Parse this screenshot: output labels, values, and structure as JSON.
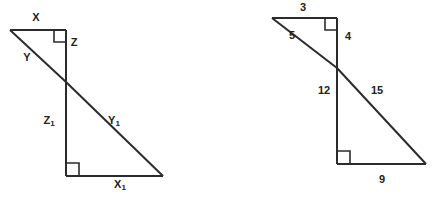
{
  "canvas": {
    "width": 433,
    "height": 197,
    "background": "#ffffff",
    "stroke_color": "#2b2b2b",
    "text_color": "#222222"
  },
  "figures": [
    {
      "id": "left-figure",
      "name": "similar-triangles-variables",
      "description": "Two similar right triangles sharing a vertex, labeled with variables",
      "small_triangle": {
        "name": "small-triangle-upper",
        "vertices": {
          "apex": [
            10,
            30
          ],
          "corner": [
            66,
            30
          ],
          "shared": [
            66,
            82
          ]
        },
        "labels": [
          {
            "key": "x",
            "text": "X",
            "sub": "",
            "x": 36,
            "y": 18
          },
          {
            "key": "y",
            "text": "Y",
            "sub": "",
            "x": 27,
            "y": 58
          },
          {
            "key": "z",
            "text": "Z",
            "sub": "",
            "x": 74,
            "y": 43
          }
        ],
        "right_angle_at": "corner"
      },
      "large_triangle": {
        "name": "large-triangle-lower",
        "vertices": {
          "shared": [
            66,
            82
          ],
          "corner": [
            66,
            176
          ],
          "far": [
            163,
            176
          ]
        },
        "labels": [
          {
            "key": "z1",
            "text": "Z",
            "sub": "1",
            "x": 49,
            "y": 121
          },
          {
            "key": "y1",
            "text": "Y",
            "sub": "1",
            "x": 114,
            "y": 121
          },
          {
            "key": "x1",
            "text": "X",
            "sub": "1",
            "x": 120,
            "y": 185
          }
        ],
        "right_angle_at": "corner"
      }
    },
    {
      "id": "right-figure",
      "name": "similar-triangles-numeric",
      "description": "Two similar right triangles sharing a vertex, labeled with side lengths",
      "small_triangle": {
        "name": "small-triangle-upper",
        "vertices": {
          "apex": [
            272,
            18
          ],
          "corner": [
            337,
            18
          ],
          "shared": [
            337,
            68
          ]
        },
        "labels": [
          {
            "key": "top",
            "text": "3",
            "sub": "",
            "x": 303,
            "y": 8
          },
          {
            "key": "hyp",
            "text": "5",
            "sub": "",
            "x": 292,
            "y": 36
          },
          {
            "key": "vert",
            "text": "4",
            "sub": "",
            "x": 348,
            "y": 37
          }
        ],
        "right_angle_at": "corner"
      },
      "large_triangle": {
        "name": "large-triangle-lower",
        "vertices": {
          "shared": [
            337,
            68
          ],
          "corner": [
            337,
            164
          ],
          "far": [
            426,
            164
          ]
        },
        "labels": [
          {
            "key": "vert",
            "text": "12",
            "sub": "",
            "x": 324,
            "y": 91
          },
          {
            "key": "hyp",
            "text": "15",
            "sub": "",
            "x": 377,
            "y": 91
          },
          {
            "key": "base",
            "text": "9",
            "sub": "",
            "x": 382,
            "y": 180
          }
        ],
        "right_angle_at": "corner"
      }
    }
  ]
}
